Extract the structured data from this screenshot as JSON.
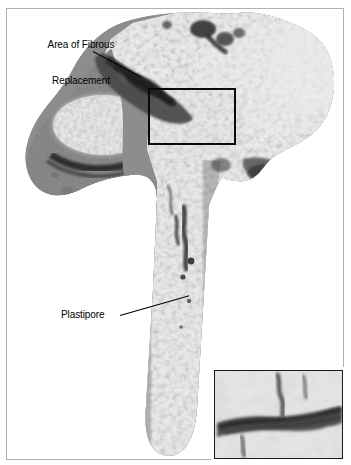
{
  "figure": {
    "kind": "histology-micrograph",
    "modality": "light microscopy, decalcified section",
    "palette": {
      "background": "#ffffff",
      "frame_border": "#b0b0b0",
      "annotation_text": "#000000",
      "leader_line": "#000000",
      "roi_box": "#0a0a0a",
      "inset_border": "#1a1a1a",
      "tissue_mid_gray": "#9a9a9a",
      "tissue_dark_gray": "#4a4a4a",
      "tissue_near_black": "#1c1c1c",
      "pore_light": "#f2f2f2",
      "pore_white": "#ffffff"
    }
  },
  "annotations": [
    {
      "id": "fibrous",
      "name": "area-of-fibrous-replacement",
      "line1": "Area of Fibrous",
      "line2": "Replacement",
      "has_leader": true
    },
    {
      "id": "plastipore",
      "name": "plastipore",
      "text": "Plastipore",
      "has_leader": true
    }
  ],
  "roi": {
    "label": "region-of-interest",
    "x": 148,
    "y": 88,
    "width": 88,
    "height": 57
  },
  "inset": {
    "label": "magnified-inset",
    "x": 214,
    "y": 370,
    "width": 129,
    "height": 89,
    "shows": "high magnification of boxed region"
  },
  "specimen": {
    "description": "Vertical bone-implant section: broad porous head at top, dense gray bone at left, long porous Plastipore shaft running down the middle",
    "regions": [
      {
        "name": "porous-head",
        "tone": "light-granular"
      },
      {
        "name": "fibrous-replacement-band",
        "tone": "dark-gray"
      },
      {
        "name": "dense-bone-mass",
        "tone": "mid-gray"
      },
      {
        "name": "plastipore-shaft",
        "tone": "light-granular"
      }
    ]
  }
}
